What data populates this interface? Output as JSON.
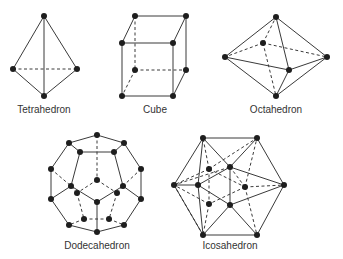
{
  "figure": {
    "shapes": [
      {
        "id": "tetrahedron",
        "label": "Tetrahedron",
        "vertices": 4,
        "label_pos": [
          44,
          110
        ]
      },
      {
        "id": "cube",
        "label": "Cube",
        "vertices": 8,
        "label_pos": [
          155,
          110
        ]
      },
      {
        "id": "octahedron",
        "label": "Octahedron",
        "vertices": 6,
        "label_pos": [
          276,
          110
        ]
      },
      {
        "id": "dodecahedron",
        "label": "Dodecahedron",
        "vertices": 20,
        "label_pos": [
          97,
          246
        ]
      },
      {
        "id": "icosahedron",
        "label": "Icosahedron",
        "vertices": 12,
        "label_pos": [
          230,
          246
        ]
      }
    ],
    "colors": {
      "line": "#3a3a3a",
      "vertex": "#1e1e1e",
      "text": "#333333",
      "background": "#ffffff"
    }
  }
}
